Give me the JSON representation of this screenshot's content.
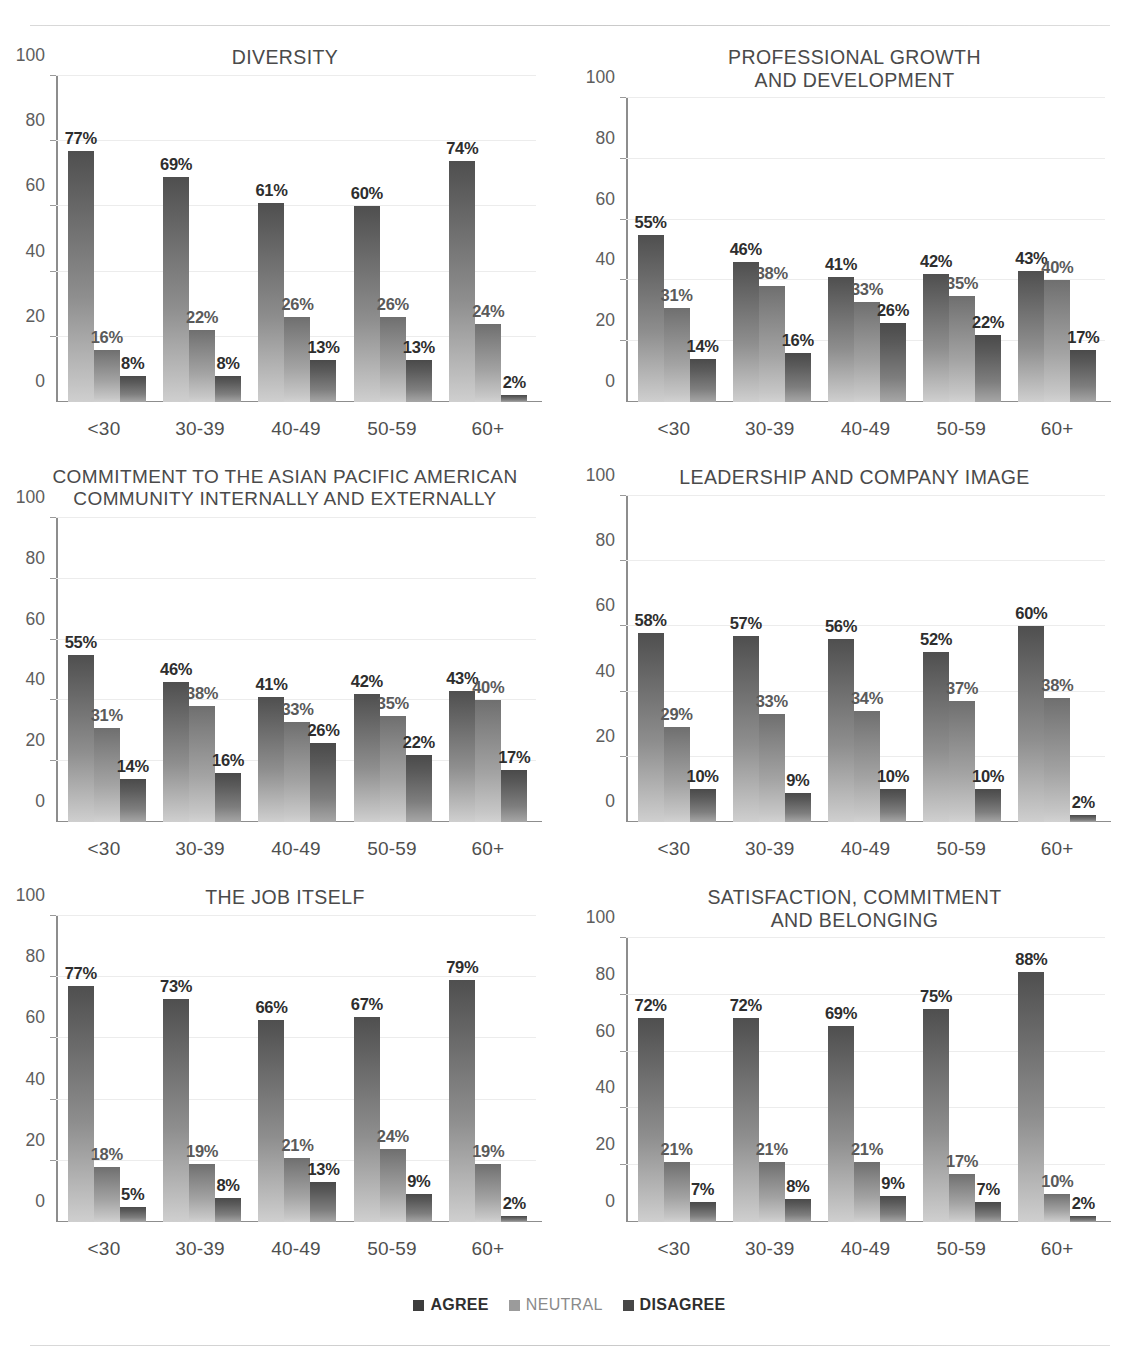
{
  "legend": {
    "items": [
      {
        "label": "AGREE",
        "color": "#3d3d3d"
      },
      {
        "label": "NEUTRAL",
        "color": "#9b9b9b"
      },
      {
        "label": "DISAGREE",
        "color": "#474747"
      }
    ]
  },
  "axis": {
    "yticks": [
      "0",
      "20",
      "40",
      "60",
      "80",
      "100"
    ],
    "ylim": [
      0,
      100
    ],
    "categories": [
      "<30",
      "30-39",
      "40-49",
      "50-59",
      "60+"
    ]
  },
  "chart_data": [
    {
      "id": "diversity",
      "type": "bar",
      "title": "DIVERSITY",
      "xlabel": "",
      "ylabel": "",
      "ylim": [
        0,
        100
      ],
      "grid": true,
      "legend_position": "bottom",
      "categories": [
        "<30",
        "30-39",
        "40-49",
        "50-59",
        "60+"
      ],
      "series": [
        {
          "name": "AGREE",
          "values": [
            77,
            69,
            61,
            60,
            74
          ],
          "labels": [
            "77%",
            "69%",
            "61%",
            "60%",
            "74%"
          ]
        },
        {
          "name": "NEUTRAL",
          "values": [
            16,
            22,
            26,
            26,
            24
          ],
          "labels": [
            "16%",
            "22%",
            "26%",
            "26%",
            "24%"
          ]
        },
        {
          "name": "DISAGREE",
          "values": [
            8,
            8,
            13,
            13,
            2
          ],
          "labels": [
            "8%",
            "8%",
            "13%",
            "13%",
            "2%"
          ]
        }
      ]
    },
    {
      "id": "professional-growth-and-development",
      "type": "bar",
      "title": "PROFESSIONAL GROWTH\nAND DEVELOPMENT",
      "xlabel": "",
      "ylabel": "",
      "ylim": [
        0,
        100
      ],
      "grid": true,
      "legend_position": "bottom",
      "categories": [
        "<30",
        "30-39",
        "40-49",
        "50-59",
        "60+"
      ],
      "series": [
        {
          "name": "AGREE",
          "values": [
            55,
            46,
            41,
            42,
            43
          ],
          "labels": [
            "55%",
            "46%",
            "41%",
            "42%",
            "43%"
          ]
        },
        {
          "name": "NEUTRAL",
          "values": [
            31,
            38,
            33,
            35,
            40
          ],
          "labels": [
            "31%",
            "38%",
            "33%",
            "35%",
            "40%"
          ]
        },
        {
          "name": "DISAGREE",
          "values": [
            14,
            16,
            26,
            22,
            17
          ],
          "labels": [
            "14%",
            "16%",
            "26%",
            "22%",
            "17%"
          ]
        }
      ]
    },
    {
      "id": "commitment-to-the-asian-pacific-american-community",
      "type": "bar",
      "title": "COMMITMENT TO THE ASIAN PACIFIC AMERICAN\nCOMMUNITY INTERNALLY AND EXTERNALLY",
      "xlabel": "",
      "ylabel": "",
      "ylim": [
        0,
        100
      ],
      "grid": true,
      "legend_position": "bottom",
      "categories": [
        "<30",
        "30-39",
        "40-49",
        "50-59",
        "60+"
      ],
      "series": [
        {
          "name": "AGREE",
          "values": [
            55,
            46,
            41,
            42,
            43
          ],
          "labels": [
            "55%",
            "46%",
            "41%",
            "42%",
            "43%"
          ]
        },
        {
          "name": "NEUTRAL",
          "values": [
            31,
            38,
            33,
            35,
            40
          ],
          "labels": [
            "31%",
            "38%",
            "33%",
            "35%",
            "40%"
          ]
        },
        {
          "name": "DISAGREE",
          "values": [
            14,
            16,
            26,
            22,
            17
          ],
          "labels": [
            "14%",
            "16%",
            "26%",
            "22%",
            "17%"
          ]
        }
      ]
    },
    {
      "id": "leadership-and-company-image",
      "type": "bar",
      "title": "LEADERSHIP AND COMPANY IMAGE",
      "xlabel": "",
      "ylabel": "",
      "ylim": [
        0,
        100
      ],
      "grid": true,
      "legend_position": "bottom",
      "categories": [
        "<30",
        "30-39",
        "40-49",
        "50-59",
        "60+"
      ],
      "series": [
        {
          "name": "AGREE",
          "values": [
            58,
            57,
            56,
            52,
            60
          ],
          "labels": [
            "58%",
            "57%",
            "56%",
            "52%",
            "60%"
          ]
        },
        {
          "name": "NEUTRAL",
          "values": [
            29,
            33,
            34,
            37,
            38
          ],
          "labels": [
            "29%",
            "33%",
            "34%",
            "37%",
            "38%"
          ]
        },
        {
          "name": "DISAGREE",
          "values": [
            10,
            9,
            10,
            10,
            2
          ],
          "labels": [
            "10%",
            "9%",
            "10%",
            "10%",
            "2%"
          ]
        }
      ]
    },
    {
      "id": "the-job-itself",
      "type": "bar",
      "title": "THE JOB ITSELF",
      "xlabel": "",
      "ylabel": "",
      "ylim": [
        0,
        100
      ],
      "grid": true,
      "legend_position": "bottom",
      "categories": [
        "<30",
        "30-39",
        "40-49",
        "50-59",
        "60+"
      ],
      "series": [
        {
          "name": "AGREE",
          "values": [
            77,
            73,
            66,
            67,
            79
          ],
          "labels": [
            "77%",
            "73%",
            "66%",
            "67%",
            "79%"
          ]
        },
        {
          "name": "NEUTRAL",
          "values": [
            18,
            19,
            21,
            24,
            19
          ],
          "labels": [
            "18%",
            "19%",
            "21%",
            "24%",
            "19%"
          ]
        },
        {
          "name": "DISAGREE",
          "values": [
            5,
            8,
            13,
            9,
            2
          ],
          "labels": [
            "5%",
            "8%",
            "13%",
            "9%",
            "2%"
          ]
        }
      ]
    },
    {
      "id": "satisfaction-commitment-and-belonging",
      "type": "bar",
      "title": "SATISFACTION, COMMITMENT\nAND BELONGING",
      "xlabel": "",
      "ylabel": "",
      "ylim": [
        0,
        100
      ],
      "grid": true,
      "legend_position": "bottom",
      "categories": [
        "<30",
        "30-39",
        "40-49",
        "50-59",
        "60+"
      ],
      "series": [
        {
          "name": "AGREE",
          "values": [
            72,
            72,
            69,
            75,
            88
          ],
          "labels": [
            "72%",
            "72%",
            "69%",
            "75%",
            "88%"
          ]
        },
        {
          "name": "NEUTRAL",
          "values": [
            21,
            21,
            21,
            17,
            10
          ],
          "labels": [
            "21%",
            "21%",
            "21%",
            "17%",
            "10%"
          ]
        },
        {
          "name": "DISAGREE",
          "values": [
            7,
            8,
            9,
            7,
            2
          ],
          "labels": [
            "7%",
            "8%",
            "9%",
            "7%",
            "2%"
          ]
        }
      ]
    }
  ]
}
